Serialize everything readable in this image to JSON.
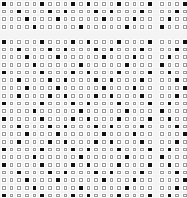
{
  "pattern": {
    "row_types": {
      "A": [
        0,
        5,
        9,
        11,
        15,
        19
      ],
      "B": [
        2,
        6,
        8,
        12,
        14,
        18
      ],
      "C": [
        3,
        7,
        13,
        17
      ],
      "D": [
        4,
        10,
        16
      ],
      "R0": [
        3
      ],
      "R1": [
        2
      ],
      "R2": [
        1
      ],
      "R3": [
        0
      ]
    },
    "colors": {
      "filled": "#111111",
      "outline": "#9a9a9a",
      "background": "#f4f4f4"
    },
    "panels": [
      {
        "name": "top-left-band",
        "x": 0,
        "y": 0,
        "cols": 20,
        "rows": [
          "A",
          "B",
          "C",
          "D"
        ]
      },
      {
        "name": "top-right-band",
        "x": 158,
        "y": 0,
        "cols": 4,
        "rows": [
          "R0",
          "R1",
          "R2",
          "R3"
        ]
      },
      {
        "name": "main-left-grid",
        "x": 0,
        "y": 38,
        "cols": 20,
        "rows": [
          "A",
          "B",
          "C",
          "D",
          "A",
          "B",
          "C",
          "B",
          "A",
          "D",
          "A",
          "B",
          "C",
          "B",
          "A",
          "D",
          "A",
          "B",
          "C",
          "D",
          "A"
        ]
      },
      {
        "name": "main-right-grid",
        "x": 158,
        "y": 38,
        "cols": 4,
        "rows": [
          "R0",
          "R1",
          "R2",
          "R3",
          "R2",
          "R1",
          "R0",
          "R1",
          "R2",
          "R3",
          "R2",
          "R1",
          "R0",
          "R1",
          "R2",
          "R3",
          "R2",
          "R1",
          "R0",
          "R1",
          "R2"
        ]
      }
    ]
  }
}
